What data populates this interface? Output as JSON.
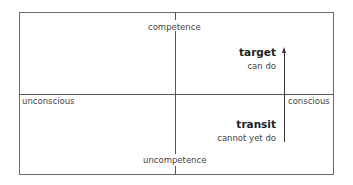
{
  "diagram": {
    "type": "quadrant",
    "axes": {
      "vertical": {
        "top": "competence",
        "bottom": "uncompetence"
      },
      "horizontal": {
        "left": "unconscious",
        "right": "conscious"
      }
    },
    "states": {
      "target": {
        "title": "target",
        "subtitle": "can do"
      },
      "transit": {
        "title": "transit",
        "subtitle": "cannot yet do"
      }
    },
    "arrow": {
      "from": "transit",
      "to": "target",
      "direction": "up"
    },
    "colors": {
      "line": "#555555",
      "text": "#333333",
      "background": "#ffffff"
    }
  }
}
